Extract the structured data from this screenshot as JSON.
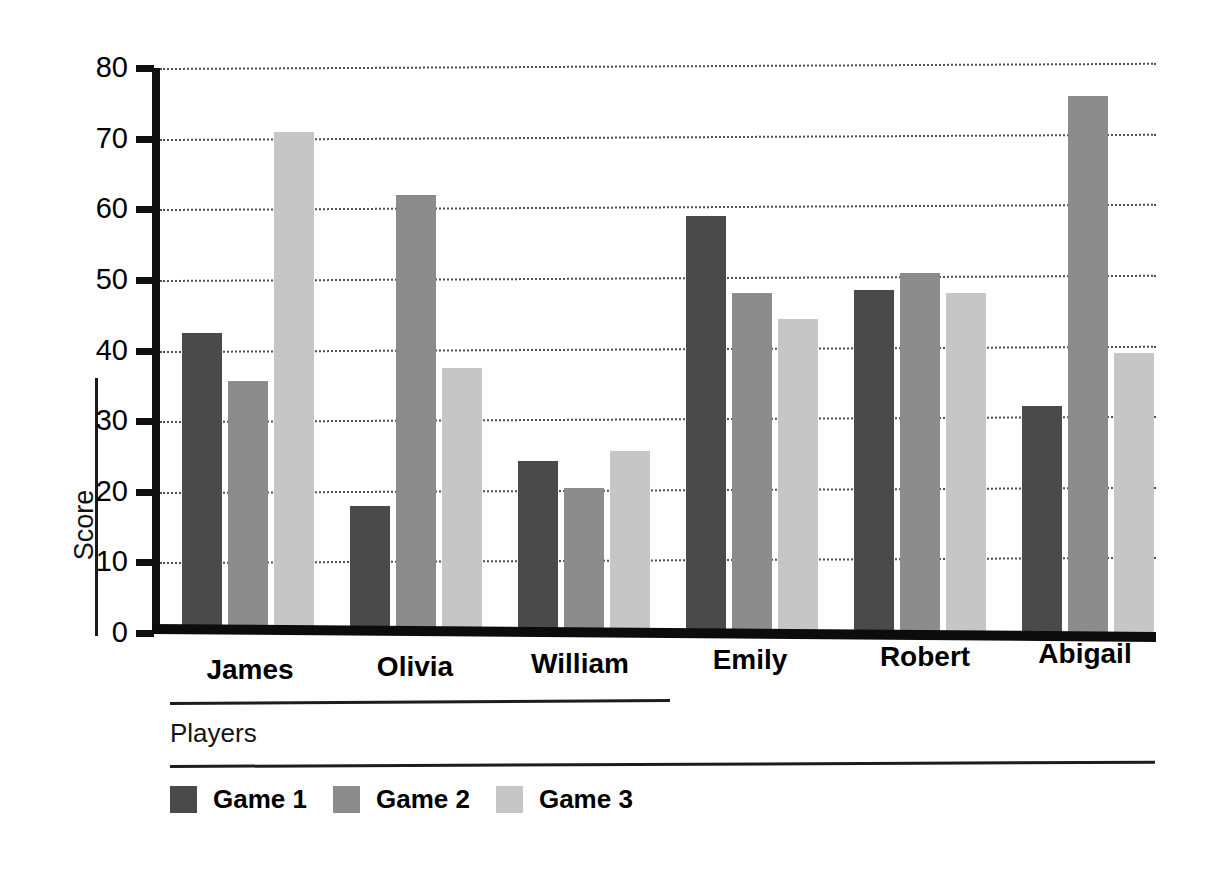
{
  "chart_data": {
    "type": "bar",
    "title": "",
    "subtitle": "",
    "xlabel": "Players",
    "ylabel": "Score",
    "categories": [
      "James",
      "Olivia",
      "William",
      "Emily",
      "Robert",
      "Abigail"
    ],
    "series": [
      {
        "name": "Game 1",
        "color": "#4a4a4a",
        "values": [
          42.5,
          18.0,
          24.3,
          59.0,
          48.5,
          32.2
        ]
      },
      {
        "name": "Game 2",
        "color": "#8c8c8c",
        "values": [
          35.7,
          62.0,
          20.5,
          48.2,
          51.0,
          76.0
        ]
      },
      {
        "name": "Game 3",
        "color": "#c6c6c6",
        "values": [
          71.0,
          37.5,
          25.8,
          44.4,
          48.2,
          39.7
        ]
      }
    ],
    "ylim": [
      0,
      80
    ],
    "yticks": [
      0,
      10,
      20,
      30,
      40,
      50,
      60,
      70,
      80
    ],
    "ytick_labels": [
      "0",
      "10",
      "20",
      "30",
      "40",
      "50",
      "60",
      "70",
      "80"
    ],
    "grid": true,
    "grid_style": "dotted",
    "grid_axis": "y",
    "legend_position": "bottom-left",
    "bar_orientation": "vertical",
    "grouped": true
  },
  "axis": {
    "y_title": "Score",
    "x_title": "Players"
  },
  "legend": {
    "entries": [
      {
        "label": "Game 1",
        "color": "#4a4a4a"
      },
      {
        "label": "Game 2",
        "color": "#8c8c8c"
      },
      {
        "label": "Game 3",
        "color": "#c6c6c6"
      }
    ]
  }
}
